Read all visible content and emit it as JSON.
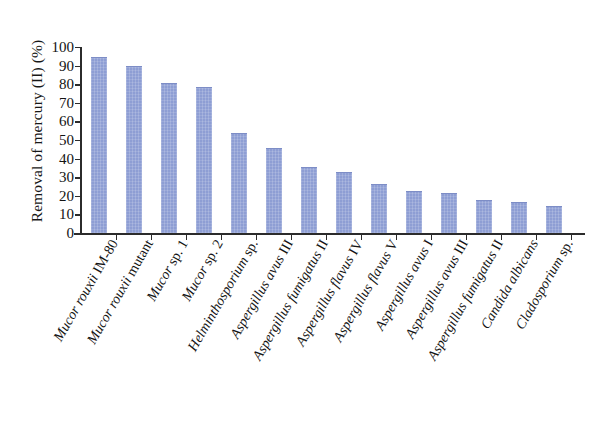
{
  "chart_data": {
    "type": "bar",
    "title": "",
    "xlabel": "",
    "ylabel": "Removal of mercury (II) (%)",
    "ylim": [
      0,
      100
    ],
    "ytick_labels": [
      "100",
      "90",
      "80",
      "70",
      "60",
      "50",
      "40",
      "30",
      "20",
      "10",
      "0"
    ],
    "ytick_values": [
      100,
      90,
      80,
      70,
      60,
      50,
      40,
      30,
      20,
      10,
      0
    ],
    "grid": false,
    "legend": "none",
    "bar_color": "#8e9ed4",
    "axis_color": "#2b2b2b",
    "categories": [
      "Mucor rouxii IM-80",
      "Mucor rouxii mutant",
      "Mucor sp. 1",
      "Mucor sp. 2",
      "Helminthosporium sp.",
      "Aspergillus avus III",
      "Aspergillus fumigatus II",
      "Aspergillus flavus IV",
      "Aspergillus flavus V",
      "Aspergillus avus I",
      "Aspergillus avus III",
      "Aspergillus fumigatus II",
      "Candida albicans",
      "Cladosporium sp."
    ],
    "category_parts": [
      {
        "italic": "Mucor rouxii",
        "roman": " IM-80"
      },
      {
        "italic": "Mucor rouxii",
        "roman": " mutant"
      },
      {
        "italic": "Mucor",
        "roman": " sp. 1"
      },
      {
        "italic": "Mucor",
        "roman": " sp. 2"
      },
      {
        "italic": "Helminthosporium",
        "roman": " sp."
      },
      {
        "italic": "Aspergillus avus",
        "roman": " III"
      },
      {
        "italic": "Aspergillus fumigatus",
        "roman": " II"
      },
      {
        "italic": "Aspergillus flavus",
        "roman": " IV"
      },
      {
        "italic": "Aspergillus flavus",
        "roman": " V"
      },
      {
        "italic": "Aspergillus avus",
        "roman": " I"
      },
      {
        "italic": "Aspergillus avus",
        "roman": " III"
      },
      {
        "italic": "Aspergillus fumigatus",
        "roman": " II"
      },
      {
        "italic": "Candida albicans",
        "roman": ""
      },
      {
        "italic": "Cladosporium",
        "roman": " sp."
      }
    ],
    "values": [
      94,
      89,
      80,
      78,
      53,
      45,
      35,
      32,
      26,
      22,
      21,
      17,
      16,
      14
    ]
  }
}
